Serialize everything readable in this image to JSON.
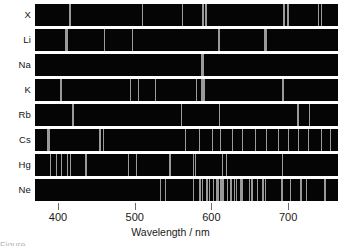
{
  "figure": {
    "axis_title": "Wavelength / nm",
    "caption_partial": "Figure"
  },
  "chart_data": {
    "type": "line",
    "title": "",
    "subtitle": "",
    "xlabel": "Wavelength / nm",
    "ylabel": "",
    "xlim": [
      370,
      765
    ],
    "grid": false,
    "legend_position": "left-row-labels",
    "tick_values": [
      400,
      500,
      600,
      700
    ],
    "tick_labels": [
      "400",
      "500",
      "600",
      "700"
    ],
    "line_color": "#9a9a9a",
    "band_color": "#050505",
    "series": [
      {
        "name": "X",
        "label": "X",
        "lines_nm": [
          415,
          510,
          562,
          589,
          593,
          694,
          700,
          739,
          744
        ],
        "line_widths": [
          2,
          1,
          1,
          2,
          2,
          2,
          2,
          1,
          1
        ]
      },
      {
        "name": "Li",
        "label": "Li",
        "lines_nm": [
          410,
          413,
          460,
          497,
          610,
          671
        ],
        "line_widths": [
          2,
          1,
          1,
          1,
          2,
          3
        ]
      },
      {
        "name": "Na",
        "label": "Na",
        "lines_nm": [
          589
        ],
        "line_widths": [
          3
        ]
      },
      {
        "name": "K",
        "label": "K",
        "lines_nm": [
          404,
          495,
          505,
          527,
          580,
          589,
          693,
          766
        ],
        "line_widths": [
          2,
          1,
          1,
          1,
          1,
          4,
          2,
          2
        ]
      },
      {
        "name": "Rb",
        "label": "Rb",
        "lines_nm": [
          420,
          561,
          610,
          713,
          728,
          780
        ],
        "line_widths": [
          2,
          1,
          1,
          2,
          1,
          2
        ]
      },
      {
        "name": "Cs",
        "label": "Cs",
        "lines_nm": [
          388,
          455,
          459,
          566,
          584,
          601,
          612,
          627,
          641,
          657,
          672,
          687,
          700,
          713,
          727,
          744,
          755
        ],
        "line_widths": [
          3,
          2,
          1,
          1,
          1,
          1,
          1,
          1,
          1,
          1,
          1,
          1,
          1,
          1,
          1,
          1,
          1
        ]
      },
      {
        "name": "Hg",
        "label": "Hg",
        "lines_nm": [
          390,
          398,
          405,
          412,
          416,
          436,
          492,
          502,
          546,
          577,
          579,
          615,
          620,
          693
        ],
        "line_widths": [
          1,
          1,
          1,
          1,
          1,
          2,
          1,
          1,
          2,
          1,
          1,
          1,
          1,
          1
        ]
      },
      {
        "name": "Ne",
        "label": "Ne",
        "lines_nm": [
          534,
          540,
          576,
          585,
          588,
          594,
          597,
          603,
          607,
          609,
          612,
          614,
          616,
          621,
          626,
          630,
          633,
          638,
          640,
          650,
          653,
          660,
          667,
          671,
          692,
          703,
          717,
          724,
          748
        ],
        "line_widths": [
          1,
          1,
          1,
          2,
          1,
          2,
          1,
          1,
          2,
          1,
          1,
          2,
          1,
          1,
          2,
          1,
          1,
          2,
          1,
          1,
          2,
          1,
          2,
          1,
          2,
          1,
          2,
          1,
          2
        ]
      }
    ]
  }
}
